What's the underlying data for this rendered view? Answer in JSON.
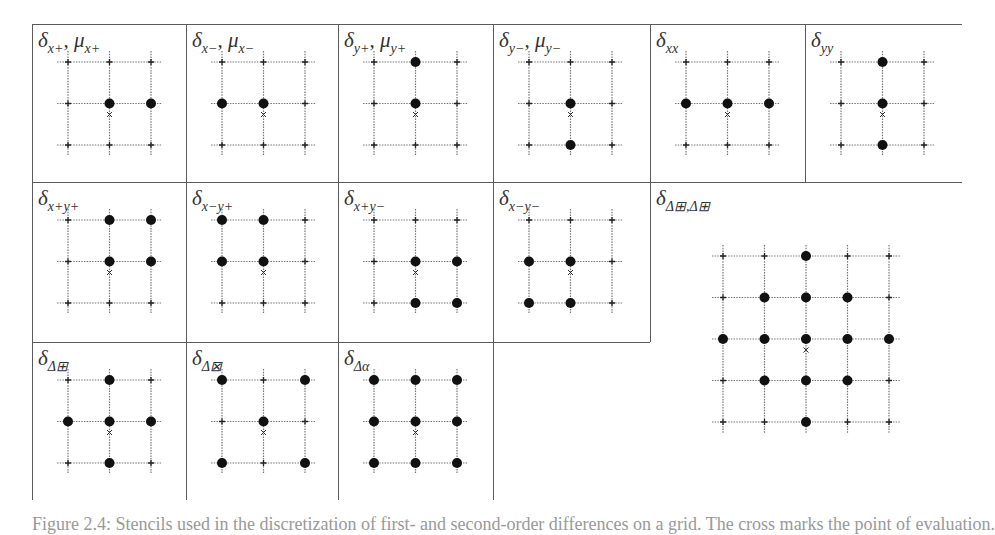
{
  "figure": {
    "colors": {
      "border": "#5a5a5a",
      "grid_line": "#777777",
      "point": "#111111",
      "cross": "#333333"
    },
    "panels": [
      {
        "id": "x+",
        "symbol": "δ",
        "sub": "x+",
        "extra_symbol": "μ",
        "extra_sub": "x+",
        "x": 32,
        "y": 24,
        "size": 3,
        "points": [
          [
            1,
            1
          ],
          [
            2,
            1
          ]
        ]
      },
      {
        "id": "x-",
        "symbol": "δ",
        "sub": "x−",
        "extra_symbol": "μ",
        "extra_sub": "x−",
        "x": 186,
        "y": 24,
        "size": 3,
        "points": [
          [
            0,
            1
          ],
          [
            1,
            1
          ]
        ]
      },
      {
        "id": "y+",
        "symbol": "δ",
        "sub": "y+",
        "extra_symbol": "μ",
        "extra_sub": "y+",
        "x": 338,
        "y": 24,
        "size": 3,
        "points": [
          [
            1,
            0
          ],
          [
            1,
            1
          ]
        ]
      },
      {
        "id": "y-",
        "symbol": "δ",
        "sub": "y−",
        "extra_symbol": "μ",
        "extra_sub": "y−",
        "x": 493,
        "y": 24,
        "size": 3,
        "points": [
          [
            1,
            1
          ],
          [
            1,
            2
          ]
        ]
      },
      {
        "id": "xx",
        "symbol": "δ",
        "sub": "xx",
        "x": 650,
        "y": 24,
        "size": 3,
        "points": [
          [
            0,
            1
          ],
          [
            1,
            1
          ],
          [
            2,
            1
          ]
        ]
      },
      {
        "id": "yy",
        "symbol": "δ",
        "sub": "yy",
        "x": 805,
        "y": 24,
        "size": 3,
        "points": [
          [
            1,
            0
          ],
          [
            1,
            1
          ],
          [
            1,
            2
          ]
        ]
      },
      {
        "id": "x+y+",
        "symbol": "δ",
        "sub": "x+y+",
        "x": 32,
        "y": 182,
        "size": 3,
        "points": [
          [
            1,
            0
          ],
          [
            2,
            0
          ],
          [
            1,
            1
          ],
          [
            2,
            1
          ]
        ]
      },
      {
        "id": "x-y+",
        "symbol": "δ",
        "sub": "x−y+",
        "x": 186,
        "y": 182,
        "size": 3,
        "points": [
          [
            0,
            0
          ],
          [
            1,
            0
          ],
          [
            0,
            1
          ],
          [
            1,
            1
          ]
        ]
      },
      {
        "id": "x+y-",
        "symbol": "δ",
        "sub": "x+y−",
        "x": 338,
        "y": 182,
        "size": 3,
        "points": [
          [
            1,
            1
          ],
          [
            2,
            1
          ],
          [
            1,
            2
          ],
          [
            2,
            2
          ]
        ]
      },
      {
        "id": "x-y-",
        "symbol": "δ",
        "sub": "x−y−",
        "x": 493,
        "y": 182,
        "size": 3,
        "points": [
          [
            0,
            1
          ],
          [
            1,
            1
          ],
          [
            0,
            2
          ],
          [
            1,
            2
          ]
        ]
      },
      {
        "id": "lap-lap",
        "symbol": "δ",
        "sub": "Δ⊞,Δ⊞",
        "x": 650,
        "y": 182,
        "size": 5,
        "grid_x": 723,
        "grid_y": 256,
        "points": [
          [
            2,
            0
          ],
          [
            1,
            1
          ],
          [
            2,
            1
          ],
          [
            3,
            1
          ],
          [
            0,
            2
          ],
          [
            1,
            2
          ],
          [
            2,
            2
          ],
          [
            3,
            2
          ],
          [
            4,
            2
          ],
          [
            1,
            3
          ],
          [
            2,
            3
          ],
          [
            3,
            3
          ],
          [
            2,
            4
          ]
        ]
      },
      {
        "id": "lap-plus",
        "symbol": "δ",
        "sub": "Δ⊞",
        "x": 32,
        "y": 342,
        "size": 3,
        "points": [
          [
            1,
            0
          ],
          [
            0,
            1
          ],
          [
            1,
            1
          ],
          [
            2,
            1
          ],
          [
            1,
            2
          ]
        ]
      },
      {
        "id": "lap-cross",
        "symbol": "δ",
        "sub": "Δ⊠",
        "x": 186,
        "y": 342,
        "size": 3,
        "points": [
          [
            0,
            0
          ],
          [
            2,
            0
          ],
          [
            1,
            1
          ],
          [
            0,
            2
          ],
          [
            2,
            2
          ]
        ]
      },
      {
        "id": "lap-alpha",
        "symbol": "δ",
        "sub": "Δα",
        "x": 338,
        "y": 342,
        "size": 3,
        "points": [
          [
            0,
            0
          ],
          [
            1,
            0
          ],
          [
            2,
            0
          ],
          [
            0,
            1
          ],
          [
            1,
            1
          ],
          [
            2,
            1
          ],
          [
            0,
            2
          ],
          [
            1,
            2
          ],
          [
            2,
            2
          ]
        ]
      }
    ],
    "caption": "Figure 2.4: Stencils used in the discretization of first- and second-order differences on a grid. The cross marks the point of evaluation."
  }
}
